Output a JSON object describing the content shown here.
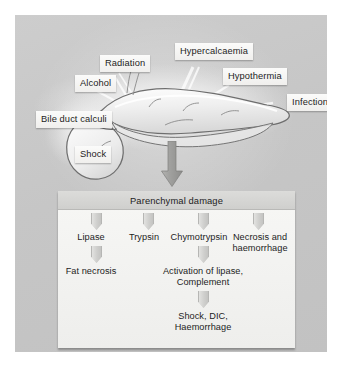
{
  "figure": {
    "panel_color": "#c9c9c9",
    "label_box_color": "#f3f3f1",
    "text_color": "#1d1d1d",
    "arrow_color": "#9d9d9b"
  },
  "causes": [
    {
      "label": "Radiation",
      "x": 85,
      "y": 40
    },
    {
      "label": "Hypercalcaemia",
      "x": 160,
      "y": 28
    },
    {
      "label": "Hypothermia",
      "x": 208,
      "y": 53
    },
    {
      "label": "Alcohol",
      "x": 60,
      "y": 60
    },
    {
      "label": "Infection",
      "x": 272,
      "y": 79
    },
    {
      "label": "Bile duct calculi",
      "x": 21,
      "y": 96
    },
    {
      "label": "Shock",
      "x": 60,
      "y": 131
    }
  ],
  "flow": {
    "header": "Parenchymal damage",
    "enzymes": [
      {
        "label": "Lipase"
      },
      {
        "label": "Trypsin"
      },
      {
        "label": "Chymotrypsin"
      },
      {
        "label": "Necrosis and haemorrhage"
      }
    ],
    "second_row": [
      {
        "label": "Fat necrosis"
      },
      {
        "label": "Activation of lipase, Complement"
      }
    ],
    "outcome": "Shock, DIC, Haemorrhage",
    "outcome_line1": "Shock, DIC,",
    "outcome_line2": "Haemorrhage",
    "necrosis_line1": "Necrosis and",
    "necrosis_line2": "haemorrhage",
    "activation_line1": "Activation of lipase,",
    "activation_line2": "Complement"
  },
  "organ": {
    "name": "pancreas-illustration",
    "description": "Pancreas with head, body, tail and duct"
  }
}
